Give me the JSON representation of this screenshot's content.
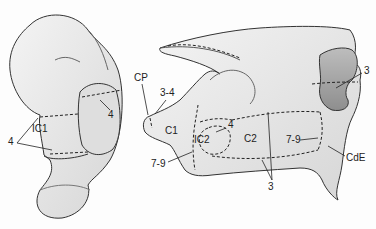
{
  "figure": {
    "left_view": {
      "labels": [
        {
          "id": "ic1",
          "text": "IC1",
          "x": 32,
          "y": 129
        },
        {
          "id": "four-left",
          "text": "4",
          "x": 11,
          "y": 140
        },
        {
          "id": "four-top",
          "text": "4",
          "x": 110,
          "y": 111
        }
      ]
    },
    "right_view": {
      "labels": [
        {
          "id": "cp",
          "text": "CP",
          "x": 136,
          "y": 76
        },
        {
          "id": "three-four",
          "text": "3-4",
          "x": 160,
          "y": 91
        },
        {
          "id": "c1",
          "text": "C1",
          "x": 166,
          "y": 128
        },
        {
          "id": "ic2",
          "text": "IC2",
          "x": 195,
          "y": 138
        },
        {
          "id": "four-mid",
          "text": "4",
          "x": 228,
          "y": 124
        },
        {
          "id": "c2",
          "text": "C2",
          "x": 245,
          "y": 136
        },
        {
          "id": "seven-nine-left",
          "text": "7-9",
          "x": 153,
          "y": 160
        },
        {
          "id": "seven-nine-right",
          "text": "7-9",
          "x": 287,
          "y": 135
        },
        {
          "id": "three-bottom",
          "text": "3",
          "x": 268,
          "y": 183
        },
        {
          "id": "three-top-right",
          "text": "3",
          "x": 363,
          "y": 68
        },
        {
          "id": "cde",
          "text": "CdE",
          "x": 347,
          "y": 153
        }
      ]
    }
  }
}
